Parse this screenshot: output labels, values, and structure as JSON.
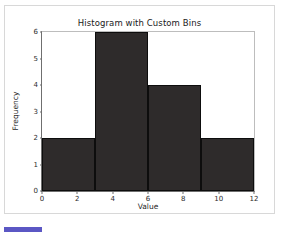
{
  "chart_data": {
    "type": "bar",
    "title": "Histogram with Custom Bins",
    "xlabel": "Value",
    "ylabel": "Frequency",
    "bin_edges": [
      0,
      3,
      6,
      9,
      12
    ],
    "categories": [
      "0-3",
      "3-6",
      "6-9",
      "9-12"
    ],
    "values": [
      2,
      6,
      4,
      2
    ],
    "xlim": [
      0,
      12
    ],
    "ylim": [
      0,
      6
    ],
    "xticks": [
      0,
      2,
      4,
      6,
      8,
      10,
      12
    ],
    "yticks": [
      0,
      1,
      2,
      3,
      4,
      5,
      6
    ],
    "xtick_labels": [
      "0",
      "2",
      "4",
      "6",
      "8",
      "10",
      "12"
    ],
    "ytick_labels": [
      "0",
      "1",
      "2",
      "3",
      "4",
      "5",
      "6"
    ],
    "grid": false,
    "legend": null,
    "bar_color": "#2e2b2b",
    "bar_edge_color": "#0d0d0d"
  },
  "ui": {
    "progress_accent_color": "#5b57c4"
  }
}
